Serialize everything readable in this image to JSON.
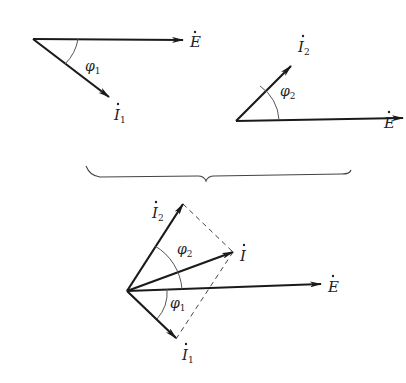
{
  "diagram": {
    "type": "phasor-diagram",
    "colors": {
      "line": "#1a1a1a",
      "arc": "#555555",
      "dashed": "#444444"
    },
    "top_left": {
      "vectors": [
        {
          "name": "E",
          "label": "E",
          "dot": true,
          "subscript": ""
        },
        {
          "name": "I1",
          "label": "I",
          "dot": true,
          "subscript": "1"
        }
      ],
      "angle": {
        "symbol": "φ",
        "subscript": "1"
      }
    },
    "top_right": {
      "vectors": [
        {
          "name": "E",
          "label": "E",
          "dot": true,
          "subscript": ""
        },
        {
          "name": "I2",
          "label": "I",
          "dot": true,
          "subscript": "2"
        }
      ],
      "angle": {
        "symbol": "φ",
        "subscript": "2"
      }
    },
    "bottom": {
      "vectors": [
        {
          "name": "I2",
          "label": "I",
          "dot": true,
          "subscript": "2"
        },
        {
          "name": "I",
          "label": "I",
          "dot": true,
          "subscript": ""
        },
        {
          "name": "E",
          "label": "E",
          "dot": true,
          "subscript": ""
        },
        {
          "name": "I1",
          "label": "I",
          "dot": true,
          "subscript": "1"
        }
      ],
      "angles": [
        {
          "symbol": "φ",
          "subscript": "2"
        },
        {
          "symbol": "φ",
          "subscript": "1"
        }
      ],
      "construction": "parallelogram (dashed)"
    }
  }
}
